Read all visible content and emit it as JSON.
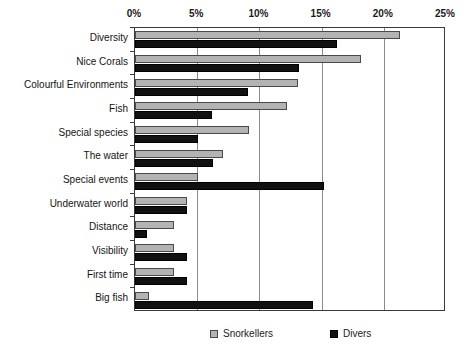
{
  "chart_data": {
    "type": "bar",
    "orientation": "horizontal",
    "title": "",
    "xlabel": "",
    "ylabel": "",
    "xlim": [
      0,
      25
    ],
    "xunit": "%",
    "grid": true,
    "legend_position": "bottom",
    "tick_labels": [
      "0%",
      "5%",
      "10%",
      "15%",
      "20%",
      "25%"
    ],
    "tick_values": [
      0,
      5,
      10,
      15,
      20,
      25
    ],
    "categories": [
      "Diversity",
      "Nice Corals",
      "Colourful Environments",
      "Fish",
      "Special species",
      "The water",
      "Special events",
      "Underwater world",
      "Distance",
      "Visibility",
      "First time",
      "Big fish"
    ],
    "series": [
      {
        "name": "Snorkellers",
        "color": "#b3b3b3",
        "values": [
          21.3,
          18.2,
          13.1,
          12.2,
          9.2,
          7.1,
          5.1,
          4.2,
          3.1,
          3.1,
          3.1,
          1.1
        ]
      },
      {
        "name": "Divers",
        "color": "#111111",
        "values": [
          16.2,
          13.2,
          9.1,
          6.2,
          5.1,
          6.3,
          15.2,
          4.2,
          1.0,
          4.2,
          4.2,
          14.3
        ]
      }
    ]
  },
  "legend": {
    "items": [
      {
        "label": "Snorkellers",
        "swatch": "light-grey-square"
      },
      {
        "label": "Divers",
        "swatch": "black-square"
      }
    ]
  }
}
